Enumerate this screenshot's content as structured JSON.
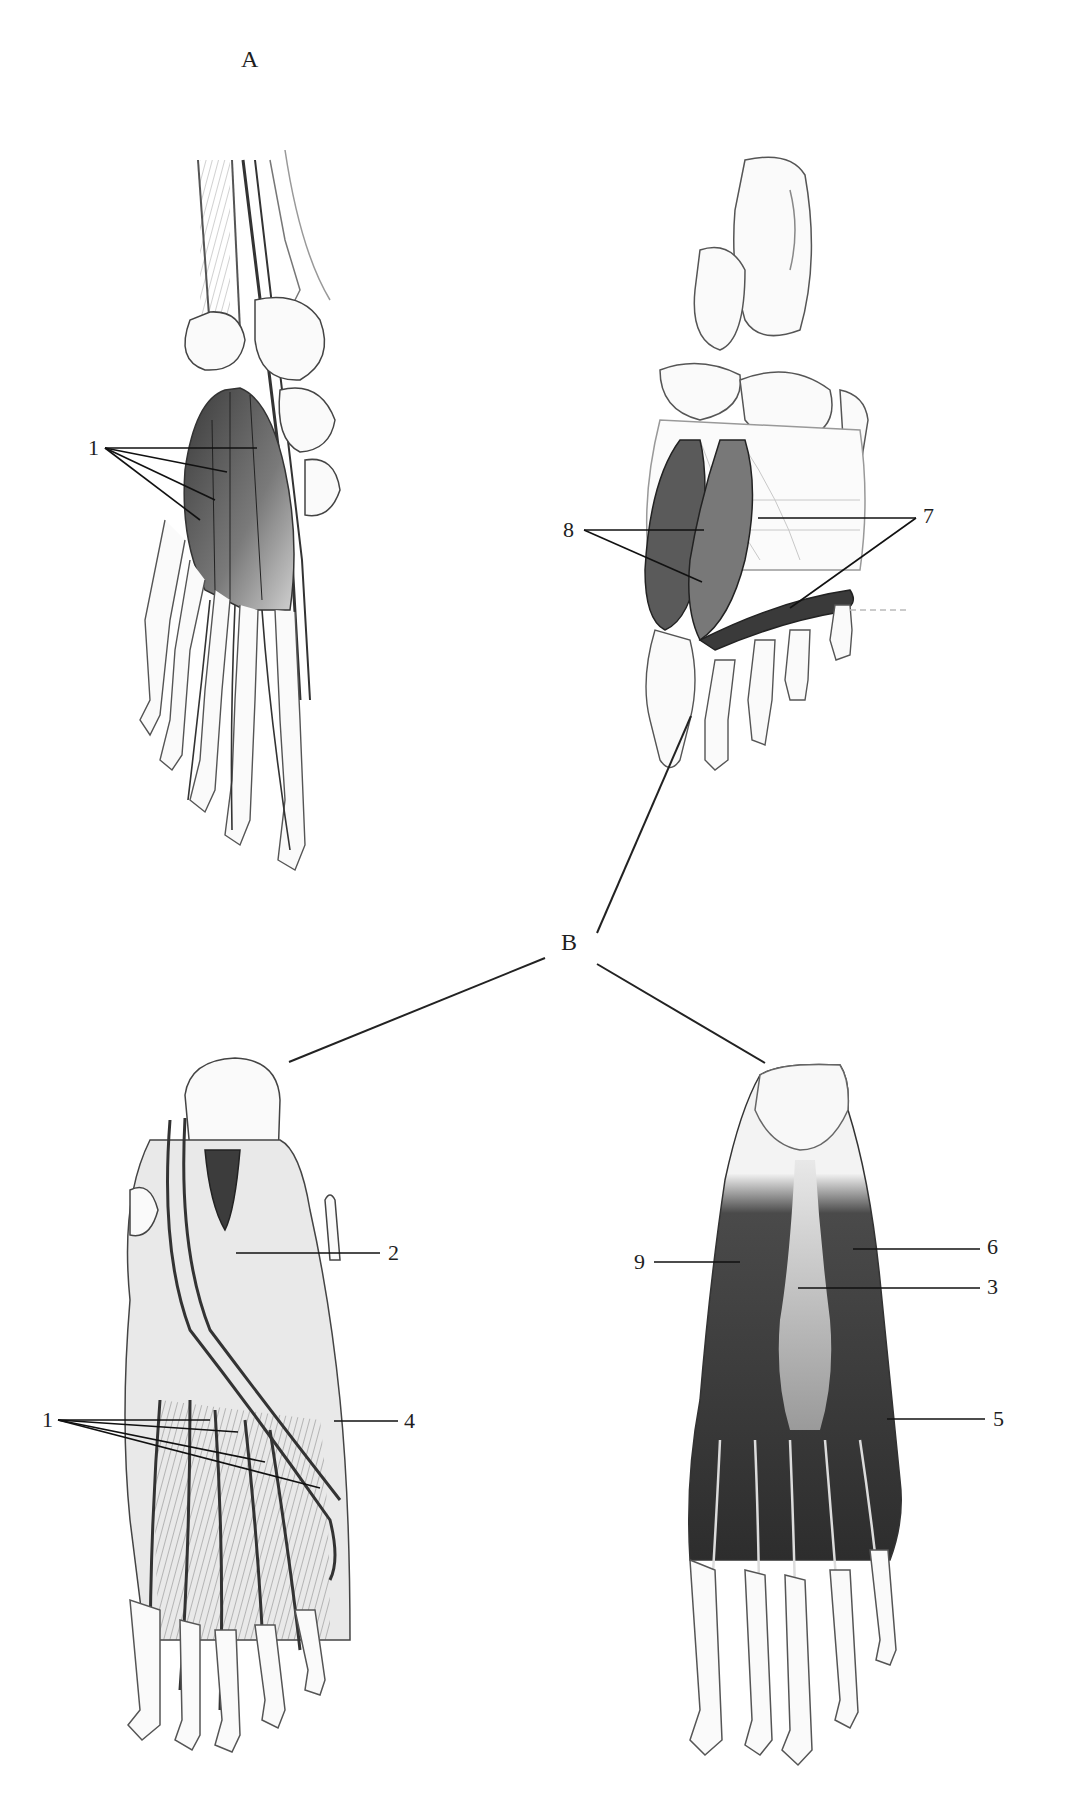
{
  "figure": {
    "panel_labels": {
      "A": "A",
      "B": "B"
    },
    "views": [
      {
        "id": "top-left",
        "panel": "A",
        "description": "Dorsal view of foot skeleton with extensor digitorum brevis"
      },
      {
        "id": "top-right",
        "panel": "B",
        "description": "Plantar skeleton view with deep muscles"
      },
      {
        "id": "bottom-left",
        "panel": "B",
        "description": "Dorsal foot muscles and tendons"
      },
      {
        "id": "bottom-right",
        "panel": "B",
        "description": "Plantar superficial muscles"
      }
    ],
    "labels": {
      "l1_top": "1",
      "l8": "8",
      "l7": "7",
      "l2": "2",
      "l1_bottom": "1",
      "l4": "4",
      "l9": "9",
      "l6": "6",
      "l3": "3",
      "l5": "5"
    },
    "colors": {
      "ink": "#1e1e1e",
      "shade": "#555555",
      "light": "#bdbdbd",
      "paper": "#ffffff"
    }
  }
}
